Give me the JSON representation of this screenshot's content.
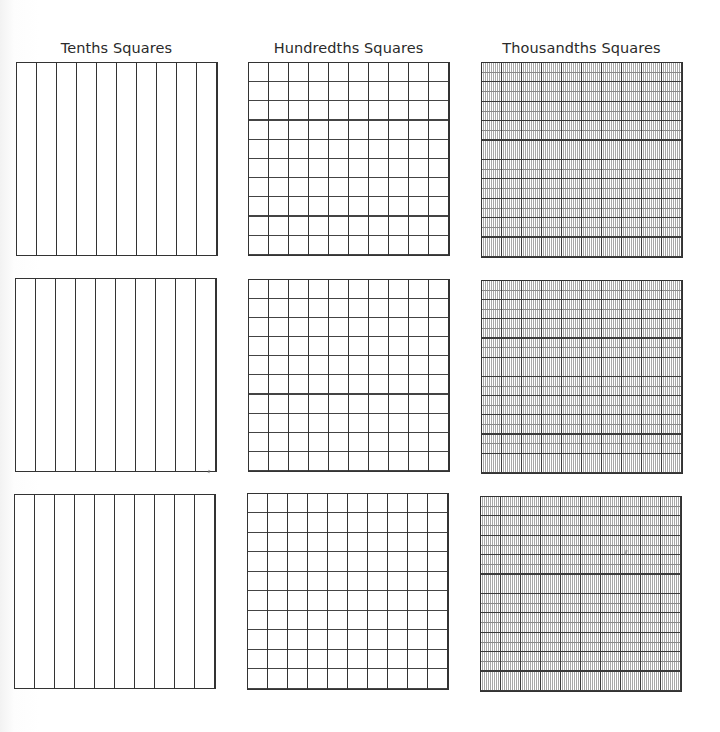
{
  "worksheet": {
    "columns": [
      {
        "id": "tenths",
        "title": "Tenths Squares",
        "divisions": {
          "columns": 10,
          "rows": 1
        },
        "parts": 10
      },
      {
        "id": "hundredths",
        "title": "Hundredths Squares",
        "divisions": {
          "columns": 10,
          "rows": 10
        },
        "parts": 100
      },
      {
        "id": "thousandths",
        "title": "Thousandths Squares",
        "divisions": {
          "columns": 100,
          "rows": 10
        },
        "parts": 1000
      }
    ],
    "rows_of_squares": 3,
    "line_color": "#333333",
    "background_color": "#ffffff"
  }
}
